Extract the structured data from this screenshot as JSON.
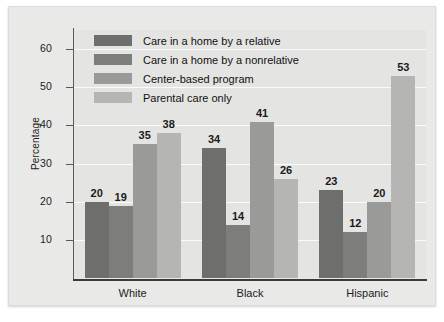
{
  "chart_data": {
    "type": "bar",
    "title": "",
    "subtitle": "",
    "xlabel": "",
    "ylabel": "Percentage",
    "categories": [
      "White",
      "Black",
      "Hispanic"
    ],
    "ylim": [
      0,
      65
    ],
    "yticks": [
      10,
      20,
      30,
      40,
      50,
      60
    ],
    "ytick_labels": [
      "10",
      "20",
      "30",
      "40",
      "50",
      "60"
    ],
    "grid": true,
    "grid_axis": "y",
    "legend_position": "top-left-inside",
    "data_labels": true,
    "series": [
      {
        "name": "Care in a home by a relative",
        "color": "#6e6e6c",
        "values": [
          20,
          34,
          23
        ],
        "labels": [
          "20",
          "34",
          "23"
        ]
      },
      {
        "name": "Care in a home by a nonrelative",
        "color": "#7d7d7b",
        "values": [
          19,
          14,
          12
        ],
        "labels": [
          "19",
          "14",
          "12"
        ]
      },
      {
        "name": "Center-based program",
        "color": "#9a9a98",
        "values": [
          35,
          41,
          20
        ],
        "labels": [
          "35",
          "41",
          "20"
        ]
      },
      {
        "name": "Parental care only",
        "color": "#b5b5b3",
        "values": [
          38,
          26,
          53
        ],
        "labels": [
          "38",
          "26",
          "53"
        ]
      }
    ]
  },
  "figure": {
    "background_color": "#e9e9e7",
    "plot_background_color": "#e4e4e2",
    "gridline_color": "#fbfbfa",
    "axis_color": "#3a3a38",
    "text_color": "#1c1c1c"
  }
}
